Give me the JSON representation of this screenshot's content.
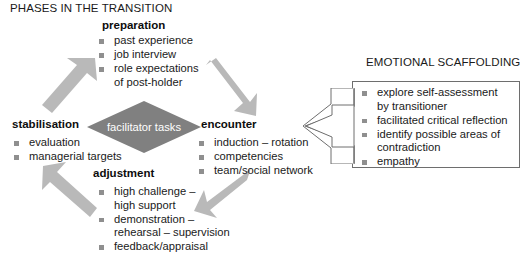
{
  "figure": {
    "title": "PHASES IN THE TRANSITION",
    "center_label": "facilitator tasks",
    "scaffolding_title": "EMOTIONAL SCAFFOLDING"
  },
  "phases": {
    "preparation": {
      "heading": "preparation",
      "items": [
        {
          "line1": "past experience",
          "line2": ""
        },
        {
          "line1": "job interview",
          "line2": ""
        },
        {
          "line1": "role expectations",
          "line2": "of post-holder"
        }
      ]
    },
    "encounter": {
      "heading": "encounter",
      "items": [
        {
          "line1": "induction – rotation",
          "line2": ""
        },
        {
          "line1": "competencies",
          "line2": ""
        },
        {
          "line1": "team/social network",
          "line2": ""
        }
      ]
    },
    "adjustment": {
      "heading": "adjustment",
      "items": [
        {
          "line1": "high challenge –",
          "line2": "high support"
        },
        {
          "line1": "demonstration –",
          "line2": "rehearsal – supervision"
        },
        {
          "line1": "feedback/appraisal",
          "line2": ""
        }
      ]
    },
    "stabilisation": {
      "heading": "stabilisation",
      "items": [
        {
          "line1": "evaluation",
          "line2": ""
        },
        {
          "line1": "managerial targets",
          "line2": ""
        }
      ]
    }
  },
  "scaffolding": {
    "items": [
      {
        "line1": "explore self-assessment",
        "line2": "by transitioner"
      },
      {
        "line1": "facilitated critical reflection",
        "line2": ""
      },
      {
        "line1": "identify possible areas of",
        "line2": "contradiction"
      },
      {
        "line1": "empathy",
        "line2": ""
      }
    ]
  },
  "arrows": {
    "stabilisation_to_preparation": "arrow-up-right",
    "preparation_to_encounter": "arrow-down-right",
    "encounter_to_adjustment": "arrow-down-left",
    "adjustment_to_stabilisation": "arrow-up-left",
    "scaffolding_to_encounter": "arrow-left-hollow"
  },
  "colors": {
    "arrow_fill": "#b9b9b9",
    "diamond_fill": "#808080",
    "bullet": "#8f8f8f",
    "box_border": "#6e6e6e",
    "text": "#1a1a1a"
  }
}
